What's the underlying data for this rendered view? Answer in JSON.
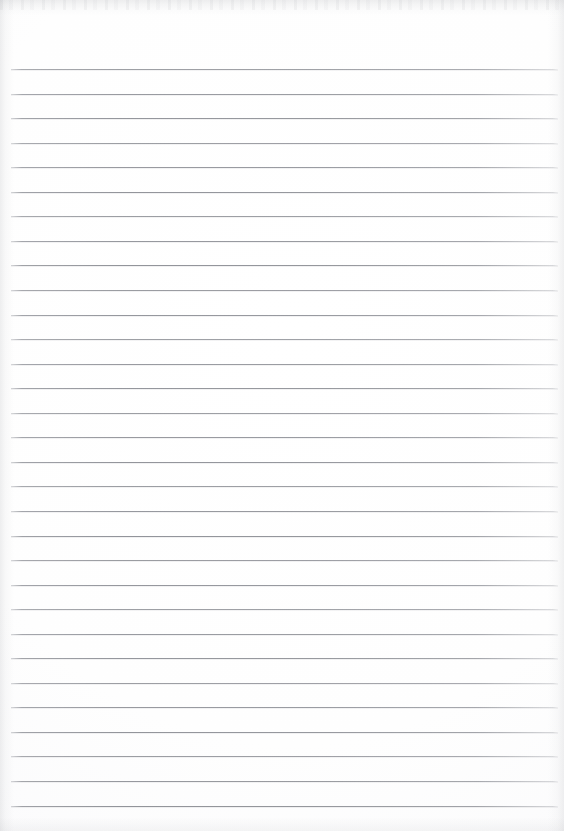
{
  "document": {
    "kind": "scanned-lined-paper",
    "title": "Blank Ruled Notebook Page",
    "content_text": "",
    "written_text": "",
    "page_width": 564,
    "page_height": 831,
    "background_color": "#ffffff",
    "rule_color": "#91939a",
    "edge_shadow_color": "#96989e"
  },
  "ruling": {
    "line_count": 31,
    "first_line_y": 69,
    "line_spacing": 24.55,
    "line_left_x": 11,
    "line_right_x": 558,
    "line_thickness": 1,
    "top_margin": 69,
    "bottom_margin": 26,
    "left_margin": 11,
    "right_margin": 6,
    "has_vertical_margin_rule": false,
    "lines_y": [
      69,
      93.6,
      118.1,
      142.7,
      167.2,
      191.8,
      216.3,
      240.9,
      265.4,
      290.0,
      314.5,
      339.1,
      363.6,
      388.2,
      412.7,
      437.3,
      461.8,
      486.4,
      510.9,
      535.5,
      560.0,
      584.6,
      609.1,
      633.7,
      658.2,
      682.8,
      707.3,
      731.9,
      756.4,
      781.0,
      805.5
    ]
  }
}
